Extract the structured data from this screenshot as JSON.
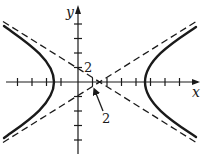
{
  "figure": {
    "type": "hyperbola-graph",
    "axes": {
      "x_label": "x",
      "y_label": "y",
      "tick_spacing_px": 14.5,
      "x_ticks_count": {
        "negative": 4,
        "positive": 7
      },
      "y_ticks_count": {
        "positive": 4,
        "negative": 4
      }
    },
    "labels": {
      "y_intercept_label": "2",
      "center_label": "2"
    },
    "curve": {
      "kind": "hyperbola",
      "orientation": "horizontal",
      "style": "solid-thick"
    },
    "asymptotes": {
      "count": 2,
      "style": "dashed"
    },
    "colors": {
      "ink": "#1a1a1a",
      "background": "#ffffff"
    }
  }
}
